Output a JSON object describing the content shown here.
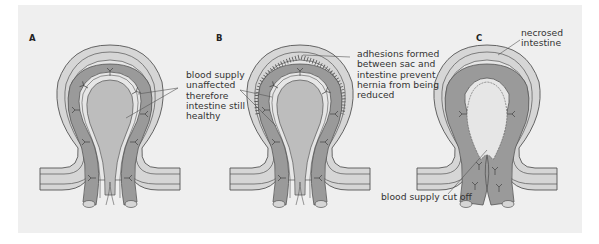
{
  "figure": {
    "panels": [
      {
        "id": "A",
        "label": "A",
        "state": "reducible hernia"
      },
      {
        "id": "B",
        "label": "B",
        "state": "irreducible hernia"
      },
      {
        "id": "C",
        "label": "C",
        "state": "strangulated hernia"
      }
    ],
    "annotations": {
      "blood_supply_unaffected": "blood supply\nunaffected\ntherefore\nintestine still\nhealthy",
      "adhesions": "adhesions formed\nbetween sac and\nintestine prevent\nhernia from being\nreduced",
      "necrosed": "necrosed\nintestine",
      "blood_cut_off": "blood supply cut off"
    },
    "colors": {
      "background": "#efefef",
      "sac_outer": "#d6d6d6",
      "intestine_wall": "#9a9a9a",
      "lumen": "#bdbdbd",
      "line": "#555555"
    }
  }
}
